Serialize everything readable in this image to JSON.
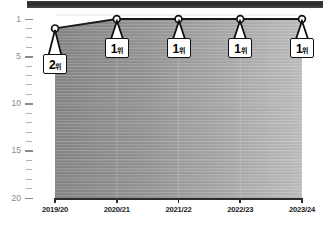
{
  "chart_data": {
    "type": "line",
    "title": "",
    "subtitle": "",
    "xlabel": "",
    "ylabel": "",
    "categories": [
      "2019/20",
      "2020/21",
      "2021/22",
      "2022/23",
      "2023/24"
    ],
    "values": [
      2,
      1,
      1,
      1,
      1
    ],
    "series": [
      {
        "name": "",
        "values": [
          2,
          1,
          1,
          1,
          1
        ]
      }
    ],
    "point_labels": [
      "2위",
      "1위",
      "1위",
      "1위",
      "1위"
    ],
    "point_label_rank": [
      "2",
      "1",
      "1",
      "1",
      "1"
    ],
    "point_label_unit": [
      "위",
      "위",
      "위",
      "위",
      "위"
    ],
    "ylim": [
      1,
      20
    ],
    "y_inverted": true,
    "yticks": [
      "1",
      "5",
      "10",
      "15",
      "20"
    ],
    "ytick_values": [
      1,
      5,
      10,
      15,
      20
    ],
    "y_minor_ticks": [
      2,
      3,
      4,
      6,
      7,
      8,
      9,
      11,
      12,
      13,
      14,
      16,
      17,
      18,
      19
    ],
    "grid": true,
    "legend": "none",
    "area_fill": true,
    "colors": {
      "line": "#1a1a1a",
      "marker_fill": "#ffffff",
      "marker_stroke": "#111111",
      "area_dark": "#8e8e8e",
      "area_light": "#b9b9b9",
      "axis": "#2c2c2c",
      "tick_label": "#8a8a8a",
      "x_label": "#1a1a1a",
      "callout_bg": "#ffffff",
      "callout_border": "#111111",
      "top_bar": "#2b2b2b"
    }
  }
}
